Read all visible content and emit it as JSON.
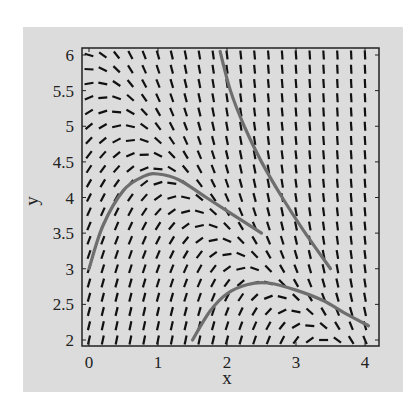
{
  "chart_data": {
    "type": "slope-field",
    "title": "",
    "xlabel": "x",
    "ylabel": "y",
    "xlim": [
      -0.1,
      4.2
    ],
    "ylim": [
      1.9,
      6.1
    ],
    "x_ticks": [
      0,
      1,
      2,
      3,
      4
    ],
    "y_ticks": [
      2,
      2.5,
      3,
      3.5,
      4,
      4.5,
      5,
      5.5,
      6
    ],
    "x_tick_labels": [
      "0",
      "1",
      "2",
      "3",
      "4"
    ],
    "y_tick_labels": [
      "2",
      "2.5",
      "3",
      "3.5",
      "4",
      "4.5",
      "5",
      "5.5",
      "6"
    ],
    "grid": false,
    "field_grid": {
      "x_start": 0,
      "x_end": 4,
      "x_step": 0.2,
      "y_start": 2,
      "y_end": 6,
      "y_step": 0.2
    },
    "nullcline_points": [
      [
        0,
        5.75
      ],
      [
        0.5,
        5.0
      ],
      [
        1,
        4.35
      ],
      [
        1.5,
        3.8
      ],
      [
        2,
        3.25
      ],
      [
        2.5,
        2.8
      ],
      [
        3,
        2.35
      ],
      [
        3.4,
        2.0
      ],
      [
        4,
        1.5
      ]
    ],
    "solution_curves": [
      {
        "name": "curve-1",
        "points": [
          [
            0,
            3.0
          ],
          [
            0.2,
            3.6
          ],
          [
            0.5,
            4.1
          ],
          [
            0.8,
            4.3
          ],
          [
            1.0,
            4.33
          ],
          [
            1.3,
            4.25
          ],
          [
            1.7,
            4.0
          ],
          [
            2.1,
            3.75
          ],
          [
            2.5,
            3.5
          ]
        ]
      },
      {
        "name": "curve-2",
        "points": [
          [
            1.9,
            6.05
          ],
          [
            2.05,
            5.5
          ],
          [
            2.25,
            5.0
          ],
          [
            2.5,
            4.5
          ],
          [
            2.8,
            4.0
          ],
          [
            3.1,
            3.55
          ],
          [
            3.5,
            3.0
          ]
        ]
      },
      {
        "name": "curve-3",
        "points": [
          [
            1.5,
            2.0
          ],
          [
            1.75,
            2.4
          ],
          [
            2.0,
            2.65
          ],
          [
            2.3,
            2.78
          ],
          [
            2.6,
            2.8
          ],
          [
            3.0,
            2.7
          ],
          [
            3.4,
            2.55
          ],
          [
            3.7,
            2.38
          ],
          [
            4.05,
            2.2
          ]
        ]
      }
    ],
    "colors": {
      "panel": "#dcdcdc",
      "frame": "#222222",
      "dash": "#111111",
      "curve": "#6e6e6e"
    }
  }
}
